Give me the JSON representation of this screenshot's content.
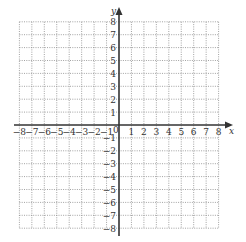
{
  "chart_data": {
    "type": "coordinate-grid",
    "title": "",
    "xlabel": "x",
    "ylabel": "y",
    "xlim": [
      -8,
      8
    ],
    "ylim": [
      -8,
      8
    ],
    "grid": true,
    "grid_style": "dotted",
    "x_ticks": [
      -8,
      -7,
      -6,
      -5,
      -4,
      -3,
      -2,
      -1,
      1,
      2,
      3,
      4,
      5,
      6,
      7,
      8
    ],
    "y_ticks": [
      -8,
      -7,
      -6,
      -5,
      -4,
      -3,
      -2,
      -1,
      1,
      2,
      3,
      4,
      5,
      6,
      7,
      8
    ],
    "origin_label": "0",
    "series": []
  },
  "labels": {
    "x_axis": "x",
    "y_axis": "y",
    "origin": "0",
    "x_ticks": [
      "−8",
      "−7",
      "−6",
      "−5",
      "−4",
      "−3",
      "−2",
      "−1",
      "1",
      "2",
      "3",
      "4",
      "5",
      "6",
      "7",
      "8"
    ],
    "y_ticks_pos": [
      "1",
      "2",
      "3",
      "4",
      "5",
      "6",
      "7",
      "8"
    ],
    "y_ticks_neg": [
      "−1",
      "−2",
      "−3",
      "−4",
      "−5",
      "−6",
      "−7",
      "−8"
    ]
  },
  "colors": {
    "axis": "#333333",
    "grid": "#8a8a8a",
    "background": "#ffffff"
  }
}
